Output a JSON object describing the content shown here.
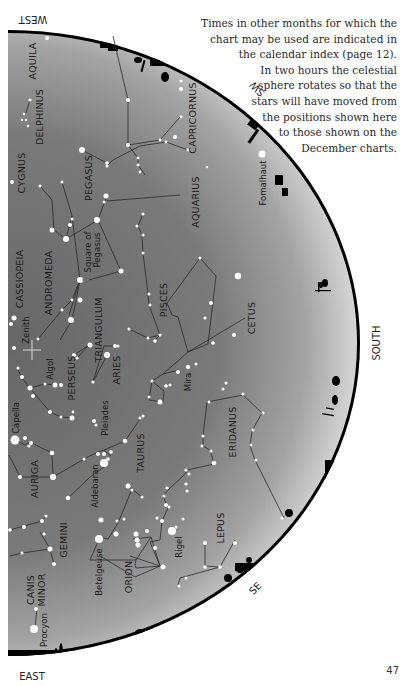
{
  "page": {
    "number": "47",
    "caption_lines": [
      "Times in other months for which the",
      "chart may be used are indicated in",
      "the calendar index (page 12).",
      "In two hours the celestial",
      "sphere rotates so that the",
      "stars will have moved from",
      "the positions shown here",
      "to those shown on the",
      "December charts."
    ]
  },
  "chart": {
    "directions": {
      "west": "WEST",
      "southwest": "SW",
      "south": "SOUTH",
      "southeast": "SE",
      "east": "EAST"
    },
    "colors": {
      "sky_dark": "#6a6a6a",
      "sky_light": "#cfcfcf",
      "horizon": "#000000",
      "star": "#ffffff"
    },
    "constellations": {
      "aquila": "AQUILA",
      "delphinus": "DELPHINUS",
      "capricornus": "CAPRICORNUS",
      "cygnus": "CYGNUS",
      "pegasus": "PEGASUS",
      "aquarius": "AQUARIUS",
      "cassiopeia": "CASSIOPEIA",
      "andromeda": "ANDROMEDA",
      "square_of_pegasus_1": "Square of",
      "square_of_pegasus_2": "Pegasus",
      "pisces": "PISCES",
      "cetus": "CETUS",
      "triangulum": "TRIANGULUM",
      "perseus": "PERSEUS",
      "aries": "ARIES",
      "auriga": "AURIGA",
      "taurus": "TAURUS",
      "eridanus": "ERIDANUS",
      "gemini": "GEMINI",
      "orion": "ORION",
      "lepus": "LEPUS",
      "canis_minor_1": "CANIS",
      "canis_minor_2": "MINOR"
    },
    "stars": {
      "fomalhaut": "Fomalhaut",
      "zenith": "Zenith",
      "algol": "Algol",
      "mira": "Mira",
      "capella": "Capella",
      "pleiades": "Pleiades",
      "aldebaran": "Aldebaran",
      "betelgeuse": "Betelgeuse",
      "rigel": "Rigel",
      "procyon": "Procyon"
    }
  }
}
